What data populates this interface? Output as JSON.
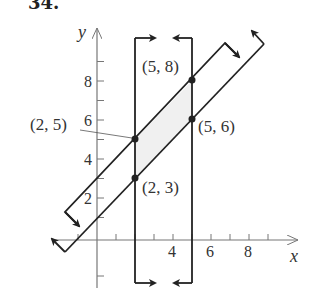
{
  "problem": {
    "number": "34."
  },
  "axes": {
    "x_label": "x",
    "y_label": "y",
    "x_ticks": [
      {
        "value": -1,
        "label": ""
      },
      {
        "value": 1,
        "label": ""
      },
      {
        "value": 2,
        "label": ""
      },
      {
        "value": 3,
        "label": ""
      },
      {
        "value": 4,
        "label": "4"
      },
      {
        "value": 5,
        "label": ""
      },
      {
        "value": 6,
        "label": "6"
      },
      {
        "value": 7,
        "label": ""
      },
      {
        "value": 8,
        "label": "8"
      },
      {
        "value": 9,
        "label": ""
      }
    ],
    "y_ticks": [
      {
        "value": -2,
        "label": ""
      },
      {
        "value": 1,
        "label": ""
      },
      {
        "value": 2,
        "label": "2"
      },
      {
        "value": 3,
        "label": ""
      },
      {
        "value": 4,
        "label": "4"
      },
      {
        "value": 5,
        "label": ""
      },
      {
        "value": 6,
        "label": "6"
      },
      {
        "value": 7,
        "label": ""
      },
      {
        "value": 8,
        "label": "8"
      },
      {
        "value": 9,
        "label": ""
      }
    ]
  },
  "labels": {
    "p25": "(2, 5)",
    "p23": "(2, 3)",
    "p58": "(5, 8)",
    "p56": "(5, 6)"
  },
  "colors": {
    "line": "#222222",
    "axis": "#777777",
    "shade": "#f0f0f0"
  },
  "chart_data": {
    "type": "line",
    "title": "34.",
    "xlabel": "x",
    "ylabel": "y",
    "xlim": [
      -2,
      10
    ],
    "ylim": [
      -3,
      10
    ],
    "grid": false,
    "boundaries": [
      {
        "name": "y = x + 3",
        "shade_side": "below",
        "arrow": "down-right"
      },
      {
        "name": "y = x + 1",
        "shade_side": "above",
        "arrow": "up-left"
      },
      {
        "name": "x = 2",
        "shade_side": "right",
        "arrow": "right"
      },
      {
        "name": "x = 5",
        "shade_side": "left",
        "arrow": "left"
      }
    ],
    "vertices": [
      {
        "x": 2,
        "y": 5,
        "label": "(2, 5)"
      },
      {
        "x": 2,
        "y": 3,
        "label": "(2, 3)"
      },
      {
        "x": 5,
        "y": 8,
        "label": "(5, 8)"
      },
      {
        "x": 5,
        "y": 6,
        "label": "(5, 6)"
      }
    ],
    "shaded_region": "parallelogram with vertices (2,3), (2,5), (5,8), (5,6)"
  }
}
